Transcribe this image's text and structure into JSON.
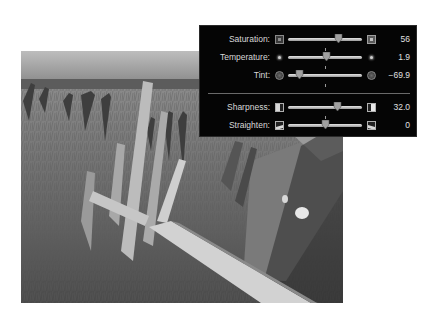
{
  "photo": {
    "description": "black-and-white photo of weathered wooden fence posts in tall grass by the sea"
  },
  "adjust_panel": {
    "rows": [
      {
        "label": "Saturation:",
        "value": "56",
        "thumb_pct": 68,
        "tick_pct": 50,
        "icon_left": "saturation-low-icon",
        "icon_right": "saturation-high-icon"
      },
      {
        "label": "Temperature:",
        "value": "1.9",
        "thumb_pct": 51,
        "tick_pct": 50,
        "icon_left": "temperature-cool-icon",
        "icon_right": "temperature-warm-icon"
      },
      {
        "label": "Tint:",
        "value": "−69.9",
        "thumb_pct": 15,
        "tick_pct": 50,
        "icon_left": "tint-green-icon",
        "icon_right": "tint-magenta-icon"
      },
      {
        "label": "Sharpness:",
        "value": "32.0",
        "thumb_pct": 66,
        "tick_pct": 50,
        "icon_left": "sharpness-low-icon",
        "icon_right": "sharpness-high-icon"
      },
      {
        "label": "Straighten:",
        "value": "0",
        "thumb_pct": 50,
        "tick_pct": 50,
        "icon_left": "straighten-left-icon",
        "icon_right": "straighten-right-icon"
      }
    ]
  },
  "colors": {
    "panel_bg": "#050505",
    "text": "#d8d8d8",
    "track": "#c8c8c8",
    "thumb": "#a0a0a0"
  }
}
